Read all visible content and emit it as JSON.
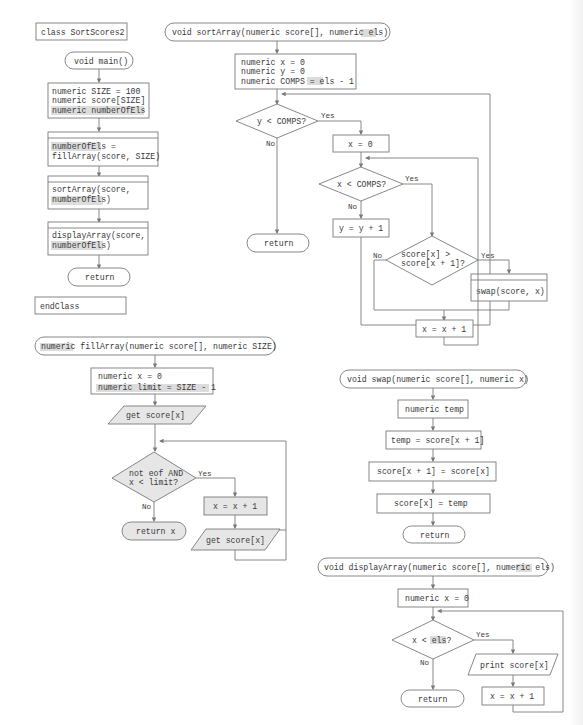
{
  "colors": {
    "line": "#7a7a7a",
    "text": "#3a3a3a",
    "highlight": "#dcdcdc",
    "shaded_fill": "#e6e6e6"
  },
  "main": {
    "class_header": "class SortScores2",
    "start": "void main()",
    "decl": [
      "numeric SIZE = 100",
      "numeric score[SIZE]",
      "numeric numberOfEls"
    ],
    "call_fill": [
      "numberOfEls =",
      "fillArray(score, SIZE)"
    ],
    "call_sort": [
      "sortArray(score,",
      "numberOfEls)"
    ],
    "call_display": [
      "displayArray(score,",
      "numberOfEls)"
    ],
    "end": "return",
    "class_end": "endClass"
  },
  "sortArray": {
    "header": "void sortArray(numeric score[], numeric els)",
    "decl": [
      "numeric x = 0",
      "numeric y = 0",
      "numeric COMPS = els - 1"
    ],
    "outer_decision": "y < COMPS?",
    "reset_x": "x = 0",
    "inner_decision": "x < COMPS?",
    "inc_y": "y = y + 1",
    "compare_decision": [
      "score[x] >",
      "score[x + 1]?"
    ],
    "swap_call": "swap(score, x)",
    "inc_x": "x = x + 1",
    "end": "return"
  },
  "fillArray": {
    "header": "numeric fillArray(numeric score[], numeric SIZE)",
    "decl": [
      "numeric x = 0",
      "numeric limit = SIZE - 1"
    ],
    "input_first": "get score[x]",
    "decision": [
      "not eof AND",
      "x < limit?"
    ],
    "inc_x": "x = x + 1",
    "input_next": "get score[x]",
    "end": "return x"
  },
  "swap": {
    "header": "void swap(numeric score[], numeric x)",
    "decl": "numeric temp",
    "step1": "temp = score[x + 1]",
    "step2": "score[x + 1] = score[x]",
    "step3": "score[x] = temp",
    "end": "return"
  },
  "displayArray": {
    "header": "void displayArray(numeric score[], numeric els)",
    "decl": "numeric x = 0",
    "decision": "x < els?",
    "output": "print score[x]",
    "inc_x": "x = x + 1",
    "end": "return"
  },
  "labels": {
    "yes": "Yes",
    "no": "No"
  }
}
